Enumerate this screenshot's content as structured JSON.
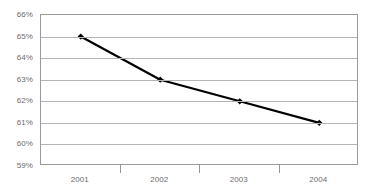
{
  "chart_data": {
    "type": "line",
    "title": "",
    "xlabel": "",
    "ylabel": "",
    "categories": [
      "2001",
      "2002",
      "2003",
      "2004"
    ],
    "values": [
      65,
      63,
      62,
      61
    ],
    "value_labels": [
      "65%",
      "63%",
      "62%",
      "61%"
    ],
    "ylim": [
      59,
      66
    ],
    "ytick_values": [
      66,
      65,
      64,
      63,
      62,
      61,
      60,
      59
    ],
    "ytick_labels": [
      "66%",
      "65%",
      "64%",
      "63%",
      "62%",
      "61%",
      "60%",
      "59%"
    ],
    "grid": true,
    "grid_axis": "y",
    "legend": false,
    "legend_position": "none",
    "marker": "diamond",
    "series": [
      {
        "name": "",
        "values": [
          65,
          63,
          62,
          61
        ]
      }
    ]
  },
  "style": {
    "line_color": "#000000",
    "marker_color": "#000000",
    "grid_color": "#b4b4b4",
    "axis_border_color": "#9a9a9a",
    "tick_text_color": "#6b6b6b",
    "plot_background": "#ffffff",
    "page_background": "#ffffff"
  }
}
